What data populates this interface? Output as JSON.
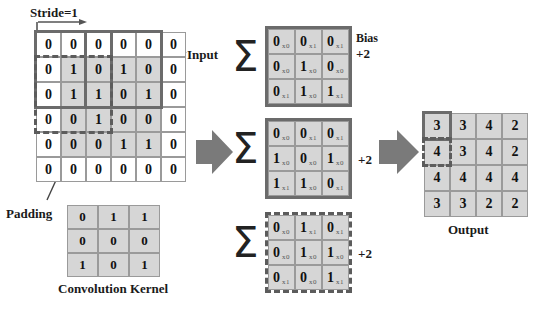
{
  "diagram": {
    "title_labels": {
      "stride": "Stride=1",
      "input": "Input",
      "padding": "Padding",
      "kernel": "Convolution Kernel",
      "bias": "Bias",
      "bias_value": "+2",
      "output": "Output",
      "plus_middle": "+2",
      "plus_bottom": "+2",
      "sigma": "Σ"
    },
    "colors": {
      "cell_shaded": "#d6d6d6",
      "cell_plain": "#ffffff",
      "grid_line": "#9a9a9a",
      "highlight_solid": "#6b6b6b",
      "highlight_dashed": "#5c5c5c",
      "arrow_fill": "#7a7a7a",
      "text": "#111111"
    }
  },
  "input_grid": {
    "rows": 6,
    "cols": 6,
    "values": [
      [
        0,
        0,
        0,
        0,
        0,
        0
      ],
      [
        0,
        1,
        0,
        1,
        0,
        0
      ],
      [
        0,
        1,
        1,
        0,
        1,
        0
      ],
      [
        0,
        0,
        1,
        0,
        0,
        0
      ],
      [
        0,
        0,
        0,
        1,
        1,
        0
      ],
      [
        0,
        0,
        0,
        0,
        0,
        0
      ]
    ],
    "shaded_region": {
      "row_start": 1,
      "row_end": 4,
      "col_start": 1,
      "col_end": 4
    },
    "highlights": [
      {
        "style": "solid",
        "row": 0,
        "col": 0,
        "size": 3
      },
      {
        "style": "dashed",
        "row": 1,
        "col": 0,
        "size": 3
      },
      {
        "style": "solid",
        "row": 0,
        "col": 2,
        "size": 3
      }
    ]
  },
  "kernel_grid": {
    "rows": 3,
    "cols": 3,
    "values": [
      [
        0,
        1,
        1
      ],
      [
        0,
        0,
        0
      ],
      [
        1,
        0,
        1
      ]
    ]
  },
  "patches": [
    {
      "name": "patch-top",
      "border": "solid",
      "values": [
        [
          0,
          0,
          0
        ],
        [
          0,
          1,
          0
        ],
        [
          0,
          1,
          1
        ]
      ],
      "weights": [
        [
          "x0",
          "x1",
          "x1"
        ],
        [
          "x0",
          "x0",
          "x0"
        ],
        [
          "x1",
          "x0",
          "x1"
        ]
      ],
      "bias": "+2"
    },
    {
      "name": "patch-middle",
      "border": "solid",
      "values": [
        [
          0,
          0,
          0
        ],
        [
          1,
          0,
          1
        ],
        [
          1,
          1,
          0
        ]
      ],
      "weights": [
        [
          "x0",
          "x1",
          "x1"
        ],
        [
          "x0",
          "x0",
          "x0"
        ],
        [
          "x1",
          "x0",
          "x1"
        ]
      ],
      "bias": "+2"
    },
    {
      "name": "patch-bottom",
      "border": "dashed",
      "values": [
        [
          0,
          1,
          0
        ],
        [
          0,
          1,
          1
        ],
        [
          0,
          0,
          1
        ]
      ],
      "weights": [
        [
          "x0",
          "x1",
          "x1"
        ],
        [
          "x0",
          "x0",
          "x0"
        ],
        [
          "x1",
          "x0",
          "x1"
        ]
      ],
      "bias": "+2"
    }
  ],
  "output_grid": {
    "rows": 4,
    "cols": 4,
    "values": [
      [
        3,
        3,
        4,
        2
      ],
      [
        4,
        3,
        4,
        2
      ],
      [
        4,
        4,
        4,
        4
      ],
      [
        3,
        3,
        2,
        2
      ]
    ],
    "highlights": [
      {
        "style": "solid",
        "row": 0,
        "col": 0,
        "size": 1
      },
      {
        "style": "dashed",
        "row": 1,
        "col": 0,
        "size": 1
      }
    ]
  }
}
